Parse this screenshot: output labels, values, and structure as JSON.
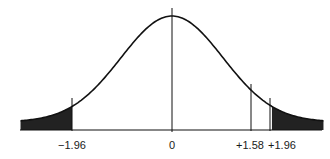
{
  "chart_data": {
    "type": "area",
    "title": "",
    "subtitle": "",
    "xlabel": "",
    "ylabel": "",
    "distribution": {
      "name": "standard normal",
      "mean": 0,
      "sd": 1
    },
    "x_range": [
      -2.97,
      2.97
    ],
    "grid": false,
    "legend": null,
    "markers": [
      {
        "z": -1.96,
        "label": "−1.96"
      },
      {
        "z": 0,
        "label": "0"
      },
      {
        "z": 1.58,
        "label": "+1.58"
      },
      {
        "z": 1.96,
        "label": "+1.96"
      }
    ],
    "shaded_regions": [
      {
        "from": -2.97,
        "to": -1.96,
        "side": "left tail"
      },
      {
        "from": 1.96,
        "to": 2.97,
        "side": "right tail"
      }
    ],
    "colors": {
      "curve": "#111111",
      "shade": "#222222",
      "axis": "#111111"
    }
  },
  "labels": {
    "neg196": "−1.96",
    "zero": "0",
    "pos158": "+1.58",
    "pos196": "+1.96"
  }
}
